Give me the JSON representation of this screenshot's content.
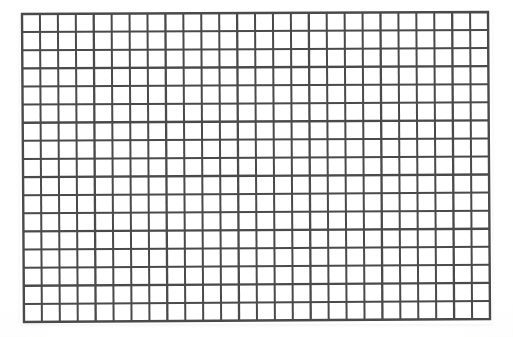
{
  "image": {
    "subject": "wire-mesh-grid-panel",
    "description": "Photograph of a rectangular welded wire mesh / grid panel on a plain white background",
    "background_color": "#ffffff",
    "canvas": {
      "width": 513,
      "height": 337
    }
  },
  "grid": {
    "columns": 26,
    "rows": 17,
    "wire_color": "#4a4a4a",
    "wire_color_light": "#6e6e6e",
    "wire_thickness_px": 2.0,
    "border_thickness_px": 2.4,
    "cell_fill": "#ffffff",
    "corners": {
      "top_left": {
        "x": 22,
        "y": 14
      },
      "top_right": {
        "x": 488,
        "y": 12
      },
      "bottom_right": {
        "x": 490,
        "y": 319
      },
      "bottom_left": {
        "x": 24,
        "y": 322
      }
    },
    "approx_cell_width_px": 17.9,
    "approx_cell_height_px": 18.1
  },
  "labels": {
    "panel_name": "wire-mesh-panel"
  }
}
